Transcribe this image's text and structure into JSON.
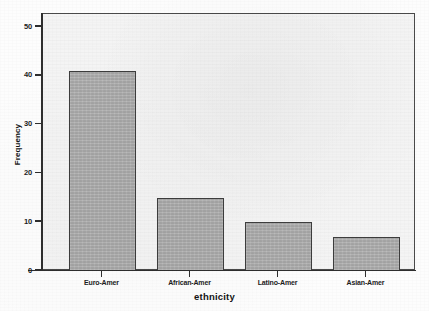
{
  "chart_data": {
    "type": "bar",
    "title": "",
    "subtitle": "",
    "xlabel": "ethnicity",
    "ylabel": "Frequency",
    "categories": [
      "Euro-Amer",
      "African-Amer",
      "Latino-Amer",
      "Asian-Amer"
    ],
    "values": [
      41,
      15,
      10,
      7
    ],
    "ylim": [
      0,
      50
    ],
    "xlim": null,
    "yticks": [
      "0",
      "10",
      "20",
      "30",
      "40",
      "50"
    ],
    "ytick_values": [
      0,
      10,
      20,
      30,
      40,
      50
    ],
    "grid": false,
    "legend": null,
    "legend_position": "none",
    "annotations": [],
    "series": [
      {
        "name": "Frequency",
        "values": [
          41,
          15,
          10,
          7
        ]
      }
    ],
    "colors": {
      "bar_fill": "#adadad",
      "bar_border": "#3d3d3d",
      "plot_background": "#f4f4f4",
      "figure_background": "#fdfdfd",
      "axis": "#2e2e2e",
      "text": "#141414"
    }
  },
  "axes": {
    "y_title": "Frequency",
    "x_title": "ethnicity"
  },
  "y_ticks": [
    {
      "label": "50",
      "value": 50
    },
    {
      "label": "40",
      "value": 40
    },
    {
      "label": "30",
      "value": 30
    },
    {
      "label": "20",
      "value": 20
    },
    {
      "label": "10",
      "value": 10
    },
    {
      "label": "0",
      "value": 0
    }
  ],
  "bars": [
    {
      "label": "Euro-Amer",
      "value": 41
    },
    {
      "label": "African-Amer",
      "value": 15
    },
    {
      "label": "Latino-Amer",
      "value": 10
    },
    {
      "label": "Asian-Amer",
      "value": 7
    }
  ]
}
